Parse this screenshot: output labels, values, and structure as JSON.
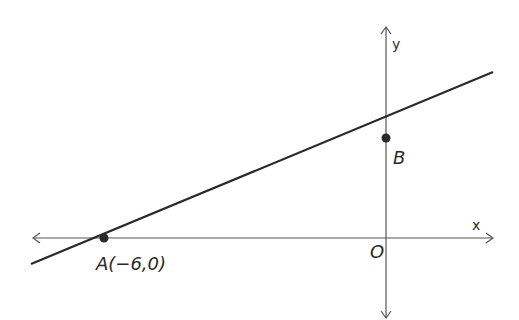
{
  "diagram": {
    "axes": {
      "x_label": "x",
      "y_label": "y",
      "origin_label": "O"
    },
    "points": [
      {
        "name": "A",
        "label": "A(−6,0)"
      },
      {
        "name": "B",
        "label": "B"
      }
    ],
    "colors": {
      "stroke": "#2a2a2a",
      "axis": "#555555",
      "background": "#ffffff"
    }
  }
}
